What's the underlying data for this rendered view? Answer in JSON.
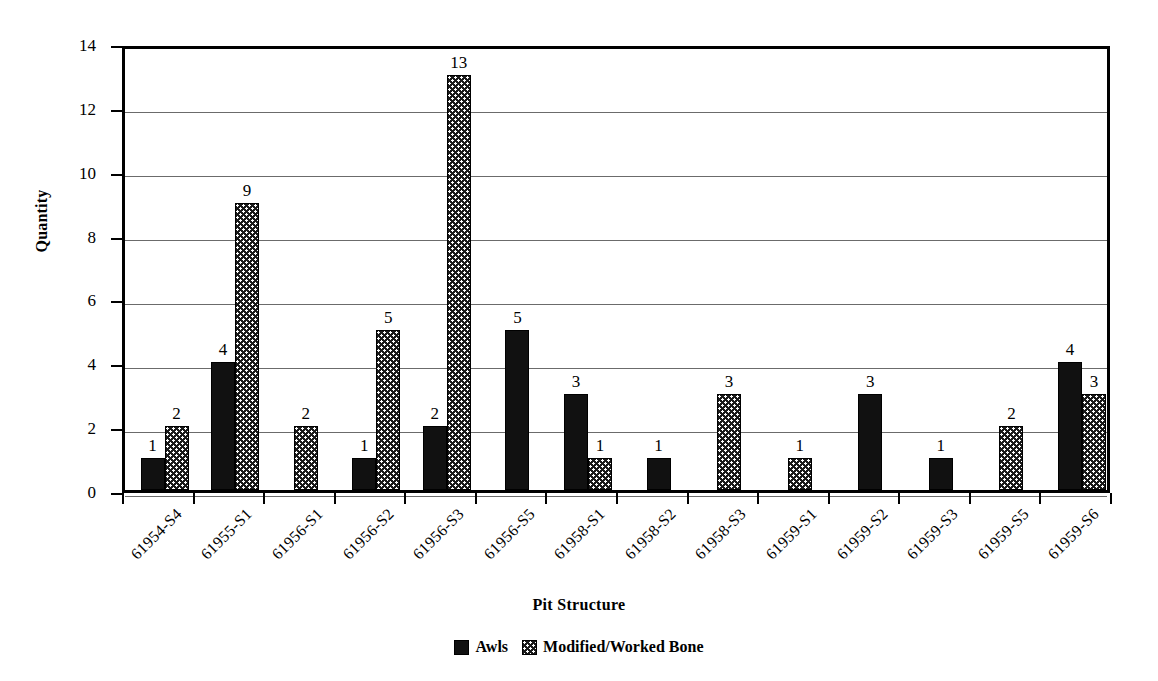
{
  "chart_data": {
    "type": "bar",
    "title": "",
    "xlabel": "Pit Structure",
    "ylabel": "Quantity",
    "ylim": [
      0,
      14
    ],
    "ytick_step": 2,
    "yticks": [
      0,
      2,
      4,
      6,
      8,
      10,
      12,
      14
    ],
    "grid": true,
    "legend_position": "bottom",
    "categories": [
      "61954-S4",
      "61955-S1",
      "61956-S1",
      "61956-S2",
      "61956-S3",
      "61956-S5",
      "61958-S1",
      "61958-S2",
      "61958-S3",
      "61959-S1",
      "61959-S2",
      "61959-S3",
      "61959-S5",
      "61959-S6"
    ],
    "series": [
      {
        "name": "Awls",
        "color": "#111111",
        "pattern": "solid",
        "values": [
          1,
          4,
          0,
          1,
          2,
          5,
          3,
          1,
          0,
          0,
          3,
          1,
          0,
          4
        ]
      },
      {
        "name": "Modified/Worked Bone",
        "color": "#1a1a1a",
        "pattern": "dotted",
        "values": [
          2,
          9,
          2,
          5,
          13,
          0,
          1,
          0,
          3,
          1,
          0,
          0,
          2,
          3
        ]
      }
    ],
    "data_labels_shown": true
  },
  "axes": {
    "y_title": "Quantity",
    "x_title": "Pit Structure",
    "y_tick_labels": [
      "0",
      "2",
      "4",
      "6",
      "8",
      "10",
      "12",
      "14"
    ]
  },
  "legend": {
    "items": [
      {
        "label": "Awls",
        "swatch": "solid-black-swatch"
      },
      {
        "label": "Modified/Worked Bone",
        "swatch": "dotted-black-swatch"
      }
    ]
  }
}
